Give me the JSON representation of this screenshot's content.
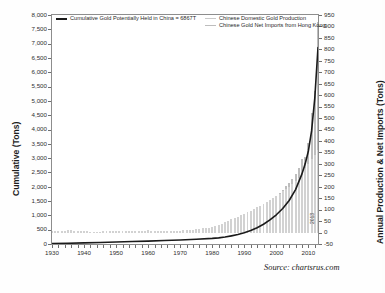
{
  "chart_data": {
    "type": "bar",
    "title": "",
    "subtitle": "",
    "xlabel": "",
    "ylabel": "Cumulative (Tons)",
    "y2label": "Annual Production & Net Imports (Tons)",
    "grid": false,
    "legend_position": "top",
    "xlim": [
      1930,
      2013
    ],
    "ylim": [
      0,
      8000
    ],
    "y2lim": [
      -50,
      950
    ],
    "x_tick_labels": [
      "1930",
      "1940",
      "1950",
      "1960",
      "1970",
      "1980",
      "1990",
      "2000",
      "2010"
    ],
    "x_ticks": [
      1930,
      1940,
      1950,
      1960,
      1970,
      1980,
      1990,
      2000,
      2010
    ],
    "y_tick_labels": [
      "0",
      "500",
      "1,000",
      "1,500",
      "2,000",
      "2,500",
      "3,000",
      "3,500",
      "4,000",
      "4,500",
      "5,000",
      "5,500",
      "6,000",
      "6,500",
      "7,000",
      "7,500",
      "8,000"
    ],
    "y_ticks": [
      0,
      500,
      1000,
      1500,
      2000,
      2500,
      3000,
      3500,
      4000,
      4500,
      5000,
      5500,
      6000,
      6500,
      7000,
      7500,
      8000
    ],
    "y2_tick_labels": [
      "-50",
      "0",
      "50",
      "100",
      "150",
      "200",
      "250",
      "300",
      "350",
      "400",
      "450",
      "500",
      "550",
      "600",
      "650",
      "700",
      "750",
      "800",
      "850",
      "900",
      "950"
    ],
    "y2_ticks": [
      -50,
      0,
      50,
      100,
      150,
      200,
      250,
      300,
      350,
      400,
      450,
      500,
      550,
      600,
      650,
      700,
      750,
      800,
      850,
      900,
      950
    ],
    "end_year_label": "2013",
    "annotations": [
      "Source: chartsrus.com"
    ],
    "series": [
      {
        "name": "Cumulative Gold Potentially Held in China = 6867T",
        "type": "line",
        "axis": "left",
        "color": "#1a1a1a",
        "x": [
          1930,
          1935,
          1940,
          1945,
          1950,
          1955,
          1960,
          1965,
          1970,
          1975,
          1980,
          1982,
          1984,
          1986,
          1988,
          1990,
          1992,
          1994,
          1996,
          1998,
          2000,
          2002,
          2004,
          2006,
          2008,
          2009,
          2010,
          2011,
          2012,
          2013
        ],
        "values": [
          15,
          25,
          40,
          55,
          70,
          85,
          100,
          120,
          140,
          165,
          195,
          215,
          245,
          285,
          330,
          390,
          470,
          570,
          690,
          840,
          1020,
          1240,
          1520,
          1900,
          2450,
          2800,
          3250,
          3950,
          5100,
          6867
        ]
      },
      {
        "name": "Chinese Domestic Gold Production",
        "type": "bar",
        "axis": "right",
        "color": "#d2d2d2",
        "x": [
          1930,
          1931,
          1932,
          1933,
          1934,
          1935,
          1936,
          1937,
          1938,
          1939,
          1940,
          1941,
          1942,
          1943,
          1944,
          1945,
          1946,
          1947,
          1948,
          1949,
          1950,
          1951,
          1952,
          1953,
          1954,
          1955,
          1956,
          1957,
          1958,
          1959,
          1960,
          1961,
          1962,
          1963,
          1964,
          1965,
          1966,
          1967,
          1968,
          1969,
          1970,
          1971,
          1972,
          1973,
          1974,
          1975,
          1976,
          1977,
          1978,
          1979,
          1980,
          1981,
          1982,
          1983,
          1984,
          1985,
          1986,
          1987,
          1988,
          1989,
          1990,
          1991,
          1992,
          1993,
          1994,
          1995,
          1996,
          1997,
          1998,
          1999,
          2000,
          2001,
          2002,
          2003,
          2004,
          2005,
          2006,
          2007,
          2008,
          2009,
          2010,
          2011,
          2012,
          2013
        ],
        "values": [
          6,
          6,
          7,
          8,
          9,
          10,
          11,
          9,
          7,
          6,
          5,
          5,
          4,
          4,
          4,
          4,
          5,
          5,
          5,
          5,
          5,
          6,
          6,
          7,
          7,
          8,
          8,
          9,
          9,
          9,
          10,
          8,
          7,
          7,
          8,
          9,
          9,
          8,
          8,
          9,
          9,
          10,
          11,
          12,
          13,
          14,
          16,
          18,
          20,
          22,
          25,
          28,
          32,
          38,
          45,
          52,
          58,
          64,
          70,
          76,
          82,
          88,
          95,
          102,
          110,
          118,
          126,
          134,
          142,
          150,
          160,
          170,
          180,
          190,
          200,
          212,
          224,
          240,
          260,
          280,
          300,
          320,
          340,
          360
        ]
      },
      {
        "name": "Chinese Gold Net Imports from Hong Kong",
        "type": "bar",
        "axis": "right",
        "color": "#bdbdbd",
        "x": [
          2001,
          2002,
          2003,
          2004,
          2005,
          2006,
          2007,
          2008,
          2009,
          2010,
          2011,
          2012,
          2013
        ],
        "values": [
          5,
          8,
          12,
          18,
          22,
          30,
          40,
          60,
          50,
          90,
          200,
          280,
          560
        ]
      }
    ]
  },
  "legend": {
    "left_entries": [
      {
        "label": "Cumulative Gold Potentially Held in China = 6867T",
        "marker": "line",
        "color": "#1a1a1a"
      }
    ],
    "right_entries": [
      {
        "label": "Chinese Domestic Gold Production",
        "marker": "bar",
        "color": "#c9c9c9"
      },
      {
        "label": "Chinese Gold Net Imports from Hong Kong",
        "marker": "bar",
        "color": "#bdbdbd"
      }
    ]
  },
  "axes": {
    "left_title": "Cumulative (Tons)",
    "right_title": "Annual Production & Net Imports (Tons)"
  },
  "footer": {
    "source": "Source: chartsrus.com"
  }
}
